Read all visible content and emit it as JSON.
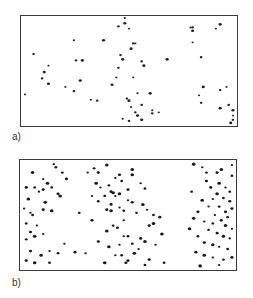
{
  "figure": {
    "panels": [
      {
        "label": "a)",
        "description": "sparse random point distribution",
        "dot_color": "#222222",
        "points": [
          [
            0.01,
            0.72
          ],
          [
            0.05,
            0.34
          ],
          [
            0.1,
            0.51
          ],
          [
            0.12,
            0.45
          ],
          [
            0.09,
            0.57
          ],
          [
            0.12,
            0.62
          ],
          [
            0.2,
            0.65
          ],
          [
            0.24,
            0.69
          ],
          [
            0.27,
            0.59
          ],
          [
            0.24,
            0.21
          ],
          [
            0.25,
            0.4
          ],
          [
            0.28,
            0.4
          ],
          [
            0.32,
            0.77
          ],
          [
            0.35,
            0.78
          ],
          [
            0.38,
            0.21
          ],
          [
            0.54,
            0.71
          ],
          [
            0.56,
            0.82
          ],
          [
            0.6,
            0.71
          ],
          [
            0.61,
            0.87
          ],
          [
            0.61,
            0.9
          ],
          [
            0.56,
            0.96
          ],
          [
            0.64,
            0.89
          ],
          [
            0.52,
            0.24
          ],
          [
            0.48,
            0.05
          ],
          [
            0.48,
            -0.01
          ],
          [
            0.45,
            0.08
          ],
          [
            0.42,
            0.63
          ],
          [
            0.5,
            0.1
          ],
          [
            0.46,
            0.35
          ],
          [
            0.47,
            0.39
          ],
          [
            0.44,
            0.56
          ],
          [
            0.45,
            0.47
          ],
          [
            0.51,
            0.29
          ],
          [
            0.53,
            0.24
          ],
          [
            0.56,
            0.41
          ],
          [
            0.57,
            0.45
          ],
          [
            0.52,
            0.56
          ],
          [
            0.49,
            0.76
          ],
          [
            0.5,
            0.78
          ],
          [
            0.51,
            0.84
          ],
          [
            0.53,
            0.89
          ],
          [
            0.54,
            0.92
          ],
          [
            0.47,
            0.95
          ],
          [
            0.5,
            0.97
          ],
          [
            0.68,
            0.39
          ],
          [
            0.79,
            0.09
          ],
          [
            0.8,
            0.09
          ],
          [
            0.8,
            0.12
          ],
          [
            0.8,
            0.23
          ],
          [
            0.84,
            0.37
          ],
          [
            0.85,
            0.65
          ],
          [
            0.83,
            0.73
          ],
          [
            0.84,
            0.8
          ],
          [
            0.93,
            0.06
          ],
          [
            0.91,
            0.1
          ],
          [
            0.93,
            0.68
          ],
          [
            0.93,
            0.85
          ],
          [
            0.96,
            0.65
          ],
          [
            0.97,
            0.82
          ],
          [
            0.99,
            0.87
          ],
          [
            0.99,
            0.92
          ],
          [
            0.99,
            0.96
          ],
          [
            0.98,
            0.99
          ]
        ]
      },
      {
        "label": "b)",
        "description": "clustered point distribution in three vertical bands",
        "dot_color": "#1a1a1a",
        "points": [
          [
            0.15,
            0.02
          ],
          [
            0.16,
            0.05
          ],
          [
            0.02,
            0.24
          ],
          [
            0.05,
            0.1
          ],
          [
            0.1,
            0.16
          ],
          [
            0.06,
            0.24
          ],
          [
            0.1,
            0.26
          ],
          [
            0.03,
            0.35
          ],
          [
            0.08,
            0.28
          ],
          [
            0.14,
            0.24
          ],
          [
            0.17,
            0.3
          ],
          [
            0.18,
            0.32
          ],
          [
            0.04,
            0.48
          ],
          [
            0.05,
            0.5
          ],
          [
            0.1,
            0.45
          ],
          [
            0.14,
            0.46
          ],
          [
            0.01,
            0.44
          ],
          [
            0.02,
            0.58
          ],
          [
            0.04,
            0.66
          ],
          [
            0.06,
            0.7
          ],
          [
            0.1,
            0.68
          ],
          [
            0.02,
            0.73
          ],
          [
            0.04,
            0.84
          ],
          [
            0.09,
            0.88
          ],
          [
            0.13,
            0.84
          ],
          [
            0.17,
            0.86
          ],
          [
            0.02,
            0.93
          ],
          [
            0.06,
            0.95
          ],
          [
            0.2,
            0.77
          ],
          [
            0.13,
            0.95
          ],
          [
            0.25,
            0.85
          ],
          [
            0.11,
            0.38
          ],
          [
            0.07,
            0.6
          ],
          [
            0.19,
            0.1
          ],
          [
            0.21,
            0.16
          ],
          [
            0.12,
            0.2
          ],
          [
            0.31,
            0.1
          ],
          [
            0.34,
            0.06
          ],
          [
            0.36,
            0.1
          ],
          [
            0.4,
            0.03
          ],
          [
            0.37,
            0.24
          ],
          [
            0.41,
            0.22
          ],
          [
            0.42,
            0.28
          ],
          [
            0.43,
            0.29
          ],
          [
            0.44,
            0.32
          ],
          [
            0.47,
            0.18
          ],
          [
            0.5,
            0.26
          ],
          [
            0.52,
            0.07
          ],
          [
            0.33,
            0.32
          ],
          [
            0.36,
            0.37
          ],
          [
            0.4,
            0.45
          ],
          [
            0.42,
            0.46
          ],
          [
            0.46,
            0.43
          ],
          [
            0.48,
            0.46
          ],
          [
            0.52,
            0.38
          ],
          [
            0.57,
            0.4
          ],
          [
            0.59,
            0.45
          ],
          [
            0.62,
            0.5
          ],
          [
            0.65,
            0.52
          ],
          [
            0.62,
            0.58
          ],
          [
            0.48,
            0.55
          ],
          [
            0.43,
            0.6
          ],
          [
            0.45,
            0.62
          ],
          [
            0.4,
            0.65
          ],
          [
            0.48,
            0.7
          ],
          [
            0.5,
            0.7
          ],
          [
            0.36,
            0.75
          ],
          [
            0.41,
            0.8
          ],
          [
            0.46,
            0.78
          ],
          [
            0.52,
            0.77
          ],
          [
            0.56,
            0.72
          ],
          [
            0.58,
            0.75
          ],
          [
            0.44,
            0.88
          ],
          [
            0.47,
            0.88
          ],
          [
            0.5,
            0.93
          ],
          [
            0.53,
            0.86
          ],
          [
            0.55,
            0.82
          ],
          [
            0.58,
            0.97
          ],
          [
            0.6,
            0.92
          ],
          [
            0.39,
            0.95
          ],
          [
            0.3,
            0.86
          ],
          [
            0.27,
            0.48
          ],
          [
            0.33,
            0.55
          ],
          [
            0.52,
            0.12
          ],
          [
            0.56,
            0.2
          ],
          [
            0.58,
            0.25
          ],
          [
            0.46,
            0.12
          ],
          [
            0.35,
            0.2
          ],
          [
            0.44,
            0.15
          ],
          [
            0.54,
            0.48
          ],
          [
            0.6,
            0.6
          ],
          [
            0.66,
            0.68
          ],
          [
            0.63,
            0.78
          ],
          [
            0.67,
            0.95
          ],
          [
            0.49,
            0.95
          ],
          [
            0.46,
            0.3
          ],
          [
            0.5,
            0.36
          ],
          [
            0.39,
            0.32
          ],
          [
            0.42,
            0.4
          ],
          [
            0.81,
            0.02
          ],
          [
            0.85,
            0.05
          ],
          [
            0.87,
            0.1
          ],
          [
            0.92,
            0.1
          ],
          [
            0.94,
            0.07
          ],
          [
            0.99,
            0.03
          ],
          [
            0.99,
            0.13
          ],
          [
            0.87,
            0.18
          ],
          [
            0.93,
            0.2
          ],
          [
            0.96,
            0.24
          ],
          [
            0.98,
            0.28
          ],
          [
            0.89,
            0.24
          ],
          [
            0.92,
            0.3
          ],
          [
            0.9,
            0.35
          ],
          [
            0.95,
            0.34
          ],
          [
            0.98,
            0.37
          ],
          [
            0.85,
            0.36
          ],
          [
            0.88,
            0.42
          ],
          [
            0.93,
            0.42
          ],
          [
            0.96,
            0.47
          ],
          [
            0.81,
            0.53
          ],
          [
            0.86,
            0.56
          ],
          [
            0.9,
            0.58
          ],
          [
            0.94,
            0.55
          ],
          [
            0.96,
            0.6
          ],
          [
            0.99,
            0.63
          ],
          [
            0.88,
            0.64
          ],
          [
            0.92,
            0.67
          ],
          [
            0.95,
            0.7
          ],
          [
            0.98,
            0.72
          ],
          [
            0.83,
            0.7
          ],
          [
            0.86,
            0.76
          ],
          [
            0.9,
            0.78
          ],
          [
            0.93,
            0.8
          ],
          [
            0.97,
            0.82
          ],
          [
            0.82,
            0.85
          ],
          [
            0.86,
            0.88
          ],
          [
            0.9,
            0.9
          ],
          [
            0.95,
            0.92
          ],
          [
            0.99,
            0.9
          ],
          [
            0.84,
            0.98
          ],
          [
            0.93,
            0.97
          ],
          [
            0.8,
            0.28
          ],
          [
            0.83,
            0.47
          ],
          [
            0.79,
            0.63
          ],
          [
            0.91,
            0.5
          ],
          [
            0.97,
            0.52
          ],
          [
            0.99,
            0.44
          ]
        ]
      }
    ]
  }
}
